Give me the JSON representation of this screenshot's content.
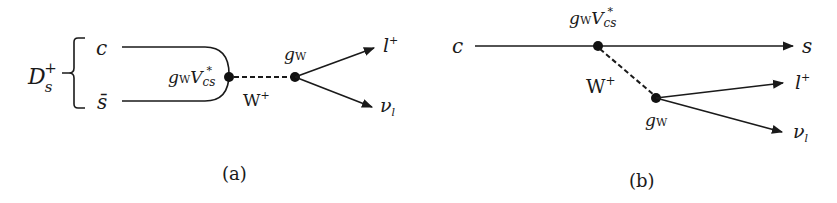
{
  "colors": {
    "ink": "#1a1a1a",
    "background": "#ffffff"
  },
  "panel_a": {
    "caption": "(a)",
    "meson": {
      "base": "D",
      "sub": "s",
      "sup": "+"
    },
    "quark_top": "c",
    "quark_bottom": "s̄",
    "vertex1_coupling": {
      "g": "g",
      "g_sub": "W",
      "v": "V",
      "v_sub": "cs",
      "v_sup": "*"
    },
    "boson": {
      "base": "W",
      "sup": "+"
    },
    "vertex2_coupling": {
      "g": "g",
      "g_sub": "W"
    },
    "lepton": {
      "base": "l",
      "sup": "+"
    },
    "neutrino": {
      "base": "ν",
      "sub": "l"
    }
  },
  "panel_b": {
    "caption": "(b)",
    "quark_in": "c",
    "quark_out": "s",
    "vertex1_coupling": {
      "g": "g",
      "g_sub": "W",
      "v": "V",
      "v_sub": "cs",
      "v_sup": "*"
    },
    "boson": {
      "base": "W",
      "sup": "+"
    },
    "vertex2_coupling": {
      "g": "g",
      "g_sub": "W"
    },
    "lepton": {
      "base": "l",
      "sup": "+"
    },
    "neutrino": {
      "base": "ν",
      "sub": "l"
    }
  }
}
